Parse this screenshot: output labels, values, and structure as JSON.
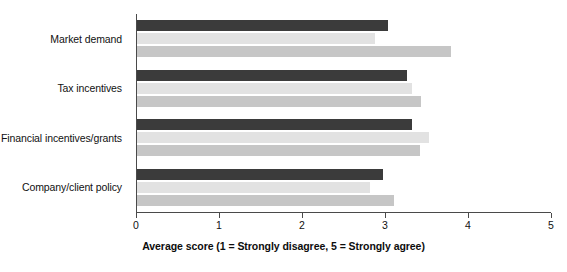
{
  "chart_data": {
    "type": "bar",
    "orientation": "horizontal",
    "title": "",
    "xlabel": "Average score (1 = Strongly disagree, 5 = Strongly agree)",
    "ylabel": "",
    "xlim": [
      0,
      5
    ],
    "xticks": [
      "0",
      "1",
      "2",
      "3",
      "4",
      "5"
    ],
    "grid": false,
    "legend": "none",
    "categories": [
      "Market demand",
      "Tax incentives",
      "Financial incentives/grants",
      "Company/client policy"
    ],
    "series": [
      {
        "name": "series-1",
        "color": "#3b3b3b",
        "values": [
          3.04,
          3.27,
          3.32,
          2.97
        ]
      },
      {
        "name": "series-2",
        "color": "#e2e2e2",
        "values": [
          2.88,
          3.33,
          3.53,
          2.82
        ]
      },
      {
        "name": "series-3",
        "color": "#c6c6c6",
        "values": [
          3.79,
          3.43,
          3.42,
          3.11
        ]
      }
    ]
  },
  "axis": {
    "line_color": "#4a4a4a"
  }
}
